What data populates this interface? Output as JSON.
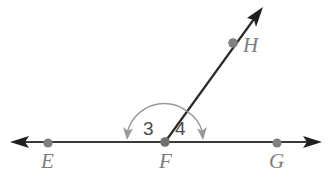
{
  "figure": {
    "background_color": "#ffffff",
    "width": 332,
    "height": 181
  },
  "colors": {
    "line": "#3a3a3a",
    "arc": "#9a9a9a",
    "point": "#808080",
    "point_label": "#7d7d7d",
    "angle_label": "#4a4a4a"
  },
  "points": [
    {
      "name": "E",
      "label": "E",
      "x": 48,
      "y": 143,
      "label_x": 41,
      "label_y": 168
    },
    {
      "name": "F",
      "label": "F",
      "x": 165,
      "y": 142,
      "label_x": 159,
      "label_y": 168
    },
    {
      "name": "G",
      "label": "G",
      "x": 277,
      "y": 143,
      "label_x": 269,
      "label_y": 168
    },
    {
      "name": "H",
      "label": "H",
      "x": 233,
      "y": 43,
      "label_x": 243,
      "label_y": 52
    }
  ],
  "lines": [
    {
      "name": "line-EG",
      "kind": "double-arrow-line",
      "x1": 14,
      "y1": 142,
      "x2": 318,
      "y2": 142
    },
    {
      "name": "ray-FH",
      "kind": "single-arrow-ray",
      "x1": 165,
      "y1": 142,
      "x2": 261,
      "y2": 10
    }
  ],
  "angles": [
    {
      "name": "angle-3",
      "label": "3",
      "vertex": "F",
      "between": [
        "ray-FH",
        "ray-FE"
      ],
      "label_x": 143,
      "label_y": 135,
      "radius": 38,
      "start_deg": 54,
      "end_deg": 180,
      "arrow_at": "end"
    },
    {
      "name": "angle-4",
      "label": "4",
      "vertex": "F",
      "between": [
        "ray-FH",
        "ray-FG"
      ],
      "label_x": 175,
      "label_y": 135,
      "radius": 38,
      "start_deg": 54,
      "end_deg": 0,
      "arrow_at": "end"
    }
  ]
}
